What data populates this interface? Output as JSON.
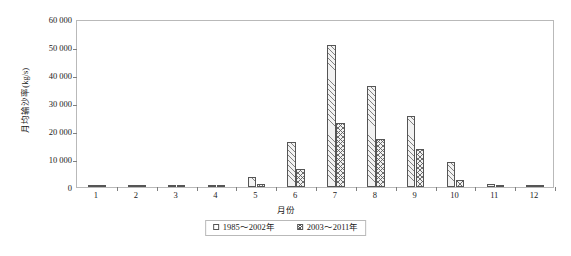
{
  "chart_data": {
    "type": "bar",
    "title": "",
    "subtitle": "",
    "xlabel": "月份",
    "ylabel": "月均输沙率(kg/s)",
    "categories": [
      "1",
      "2",
      "3",
      "4",
      "5",
      "6",
      "7",
      "8",
      "9",
      "10",
      "11",
      "12"
    ],
    "series": [
      {
        "name": "1985～2002年",
        "pattern": "diagonal-hatch",
        "values": [
          20,
          40,
          180,
          700,
          3500,
          16000,
          50800,
          36200,
          25300,
          8800,
          1200,
          200
        ]
      },
      {
        "name": "2003～2011年",
        "pattern": "cross-hatch",
        "values": [
          10,
          20,
          100,
          450,
          900,
          6300,
          23000,
          17000,
          13400,
          2400,
          400,
          80
        ]
      }
    ],
    "ylim": [
      0,
      60000
    ],
    "ytick_values": [
      0,
      10000,
      20000,
      30000,
      40000,
      50000,
      60000
    ],
    "ytick_labels": [
      "0",
      "10 000",
      "20 000",
      "30 000",
      "40 000",
      "50 000",
      "60 000"
    ],
    "grid": false,
    "legend_position": "below-center",
    "axis_color": "#b9b9b9",
    "bar_edge_color": "#555555",
    "text_color": "#1a1a1a"
  }
}
